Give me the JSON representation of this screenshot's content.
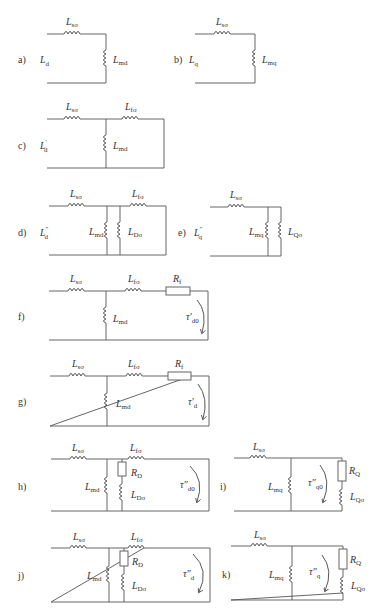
{
  "figure": {
    "panels": [
      {
        "id": "a",
        "tag": "a)",
        "port": {
          "main": "L",
          "sub": "d",
          "prime": ""
        },
        "elements": {
          "Lsigma": {
            "main": "L",
            "sub": "sσ"
          },
          "Lm": {
            "main": "L",
            "sub": "md"
          }
        }
      },
      {
        "id": "b",
        "tag": "b)",
        "port": {
          "main": "L",
          "sub": "q",
          "prime": ""
        },
        "elements": {
          "Lsigma": {
            "main": "L",
            "sub": "sσ"
          },
          "Lm": {
            "main": "L",
            "sub": "mq"
          }
        }
      },
      {
        "id": "c",
        "tag": "c)",
        "port": {
          "main": "L",
          "sub": "d",
          "prime": "′"
        },
        "elements": {
          "Lsigma": {
            "main": "L",
            "sub": "sσ"
          },
          "Lf": {
            "main": "L",
            "sub": "fσ"
          },
          "Lm": {
            "main": "L",
            "sub": "md"
          }
        }
      },
      {
        "id": "d",
        "tag": "d)",
        "port": {
          "main": "L",
          "sub": "d",
          "prime": "″"
        },
        "elements": {
          "Lsigma": {
            "main": "L",
            "sub": "sσ"
          },
          "Lf": {
            "main": "L",
            "sub": "fσ"
          },
          "Lm": {
            "main": "L",
            "sub": "md"
          },
          "LD": {
            "main": "L",
            "sub": "Dσ"
          }
        }
      },
      {
        "id": "e",
        "tag": "e)",
        "port": {
          "main": "L",
          "sub": "q",
          "prime": "″"
        },
        "elements": {
          "Lsigma": {
            "main": "L",
            "sub": "sσ"
          },
          "Lm": {
            "main": "L",
            "sub": "mq"
          },
          "LQ": {
            "main": "L",
            "sub": "Qσ"
          }
        }
      },
      {
        "id": "f",
        "tag": "f)",
        "elements": {
          "Lsigma": {
            "main": "L",
            "sub": "sσ"
          },
          "Lf": {
            "main": "L",
            "sub": "fσ"
          },
          "Rf": {
            "main": "R",
            "sub": "f"
          },
          "Lm": {
            "main": "L",
            "sub": "md"
          },
          "tau": {
            "main": "τ′",
            "sub": "d0"
          }
        }
      },
      {
        "id": "g",
        "tag": "g)",
        "elements": {
          "Lsigma": {
            "main": "L",
            "sub": "sσ"
          },
          "Lf": {
            "main": "L",
            "sub": "fσ"
          },
          "Rf": {
            "main": "R",
            "sub": "f"
          },
          "Lm": {
            "main": "L",
            "sub": "md"
          },
          "tau": {
            "main": "τ′",
            "sub": "d"
          }
        }
      },
      {
        "id": "h",
        "tag": "h)",
        "elements": {
          "Lsigma": {
            "main": "L",
            "sub": "sσ"
          },
          "Lf": {
            "main": "L",
            "sub": "fσ"
          },
          "Lm": {
            "main": "L",
            "sub": "md"
          },
          "RD": {
            "main": "R",
            "sub": "D"
          },
          "LD": {
            "main": "L",
            "sub": "Dσ"
          },
          "tau": {
            "main": "τ″",
            "sub": "d0"
          }
        }
      },
      {
        "id": "i",
        "tag": "i)",
        "elements": {
          "Lsigma": {
            "main": "L",
            "sub": "sσ"
          },
          "Lm": {
            "main": "L",
            "sub": "mq"
          },
          "RQ": {
            "main": "R",
            "sub": "Q"
          },
          "LQ": {
            "main": "L",
            "sub": "Qσ"
          },
          "tau": {
            "main": "τ″",
            "sub": "q0"
          }
        }
      },
      {
        "id": "j",
        "tag": "j)",
        "elements": {
          "Lsigma": {
            "main": "L",
            "sub": "sσ"
          },
          "Lf": {
            "main": "L",
            "sub": "fσ"
          },
          "Lm": {
            "main": "L",
            "sub": "md"
          },
          "RD": {
            "main": "R",
            "sub": "D"
          },
          "LD": {
            "main": "L",
            "sub": "Dσ"
          },
          "tau": {
            "main": "τ″",
            "sub": "d"
          }
        }
      },
      {
        "id": "k",
        "tag": "k)",
        "elements": {
          "Lsigma": {
            "main": "L",
            "sub": "sσ"
          },
          "Lm": {
            "main": "L",
            "sub": "mq"
          },
          "RQ": {
            "main": "R",
            "sub": "Q"
          },
          "LQ": {
            "main": "L",
            "sub": "Qσ"
          },
          "tau": {
            "main": "τ″",
            "sub": "q"
          }
        }
      }
    ]
  }
}
